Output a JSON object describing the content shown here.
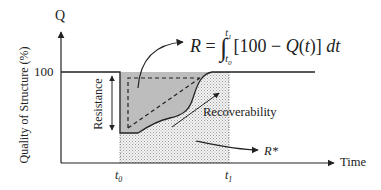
{
  "diagram": {
    "type": "resilience-triangle",
    "y_axis": {
      "symbol": "Q",
      "title": "Quality of Structure (%)",
      "tick_100": "100"
    },
    "x_axis": {
      "title": "Time",
      "t0": "t0",
      "t1": "t1"
    },
    "annotations": {
      "resistance": "Resistance",
      "recoverability": "Recoverability",
      "r_star": "R*"
    },
    "formula": {
      "text": "R = ∫_{t0}^{t1} [100 − Q(t)] dt",
      "lhs": "R =",
      "integral_upper": "t1",
      "integral_lower": "t0",
      "integrand": "[100 − Q(t)] dt"
    },
    "colors": {
      "line": "#222222",
      "shaded_area": "#bdbdbd",
      "dotted_area": "#d9d9d9"
    }
  }
}
